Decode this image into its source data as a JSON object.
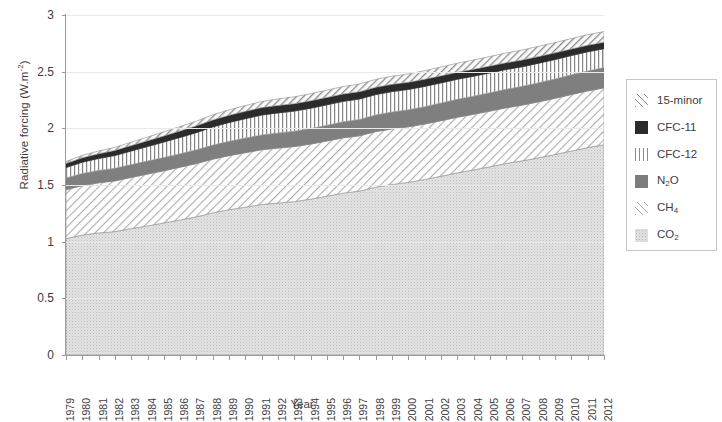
{
  "chart_data": {
    "type": "area",
    "title": "",
    "subtitle": "",
    "xlabel": "Year",
    "ylabel": "Radiative forcing (W.m-2)",
    "ylabel_display": "Radiative forcing (W.m",
    "ylabel_exponent": "-2",
    "ylabel_tail": ")",
    "ylim": [
      0,
      3
    ],
    "ytick_values": [
      0,
      0.5,
      1,
      1.5,
      2,
      2.5,
      3
    ],
    "ytick_labels": [
      "0",
      "0.5",
      "1",
      "1.5",
      "2",
      "2.5",
      "3"
    ],
    "grid": true,
    "legend_position": "right-outside",
    "stacked": true,
    "stack_order_bottom_to_top": [
      "CO2",
      "CH4",
      "N2O",
      "CFC-12",
      "CFC-11",
      "15-minor"
    ],
    "x": [
      1979,
      1980,
      1981,
      1982,
      1983,
      1984,
      1985,
      1986,
      1987,
      1988,
      1989,
      1990,
      1991,
      1992,
      1993,
      1994,
      1995,
      1996,
      1997,
      1998,
      1999,
      2000,
      2001,
      2002,
      2003,
      2004,
      2005,
      2006,
      2007,
      2008,
      2009,
      2010,
      2011,
      2012
    ],
    "categories": [
      "1979",
      "1980",
      "1981",
      "1982",
      "1983",
      "1984",
      "1985",
      "1986",
      "1987",
      "1988",
      "1989",
      "1990",
      "1991",
      "1992",
      "1993",
      "1994",
      "1995",
      "1996",
      "1997",
      "1998",
      "1999",
      "2000",
      "2001",
      "2002",
      "2003",
      "2004",
      "2005",
      "2006",
      "2007",
      "2008",
      "2009",
      "2010",
      "2011",
      "2012"
    ],
    "series": [
      {
        "name": "CO2",
        "label": "CO2",
        "pattern": "light-speckle",
        "color": "#e2e2e2",
        "values": [
          1.027,
          1.058,
          1.077,
          1.089,
          1.115,
          1.139,
          1.165,
          1.191,
          1.219,
          1.254,
          1.282,
          1.304,
          1.328,
          1.341,
          1.353,
          1.375,
          1.401,
          1.428,
          1.446,
          1.481,
          1.505,
          1.523,
          1.549,
          1.577,
          1.607,
          1.633,
          1.661,
          1.69,
          1.713,
          1.74,
          1.769,
          1.8,
          1.83,
          1.855
        ]
      },
      {
        "name": "CH4",
        "label": "CH4",
        "pattern": "diagonal-hatch-light",
        "color": "#a8a8a8",
        "values": [
          0.431,
          0.437,
          0.442,
          0.447,
          0.452,
          0.457,
          0.461,
          0.466,
          0.47,
          0.474,
          0.477,
          0.481,
          0.483,
          0.485,
          0.486,
          0.486,
          0.487,
          0.488,
          0.488,
          0.49,
          0.49,
          0.49,
          0.489,
          0.49,
          0.491,
          0.491,
          0.491,
          0.491,
          0.492,
          0.494,
          0.496,
          0.498,
          0.5,
          0.502
        ]
      },
      {
        "name": "N2O",
        "label": "N2O",
        "pattern": "solid-medium-gray",
        "color": "#7d7d7d",
        "values": [
          0.104,
          0.107,
          0.109,
          0.111,
          0.113,
          0.115,
          0.117,
          0.119,
          0.121,
          0.124,
          0.126,
          0.129,
          0.131,
          0.133,
          0.135,
          0.137,
          0.139,
          0.142,
          0.144,
          0.147,
          0.149,
          0.151,
          0.153,
          0.156,
          0.158,
          0.16,
          0.162,
          0.164,
          0.166,
          0.169,
          0.171,
          0.174,
          0.176,
          0.179
        ]
      },
      {
        "name": "CFC-12",
        "label": "CFC-12",
        "pattern": "vertical-lines",
        "color": "#8a8a8a",
        "values": [
          0.092,
          0.099,
          0.106,
          0.113,
          0.12,
          0.128,
          0.136,
          0.144,
          0.152,
          0.16,
          0.166,
          0.171,
          0.175,
          0.177,
          0.178,
          0.179,
          0.18,
          0.18,
          0.18,
          0.18,
          0.18,
          0.179,
          0.179,
          0.178,
          0.177,
          0.176,
          0.175,
          0.174,
          0.173,
          0.172,
          0.171,
          0.17,
          0.169,
          0.167
        ]
      },
      {
        "name": "CFC-11",
        "label": "CFC-11",
        "pattern": "solid-black",
        "color": "#2b2b2b",
        "values": [
          0.036,
          0.039,
          0.042,
          0.045,
          0.048,
          0.051,
          0.054,
          0.057,
          0.06,
          0.062,
          0.064,
          0.065,
          0.066,
          0.066,
          0.066,
          0.066,
          0.066,
          0.065,
          0.065,
          0.064,
          0.064,
          0.063,
          0.063,
          0.062,
          0.062,
          0.061,
          0.061,
          0.06,
          0.06,
          0.059,
          0.059,
          0.058,
          0.058,
          0.057
        ]
      },
      {
        "name": "15-minor",
        "label": "15-minor",
        "pattern": "diagonal-hatch",
        "color": "#8e8e8e",
        "values": [
          0.018,
          0.021,
          0.024,
          0.027,
          0.03,
          0.033,
          0.036,
          0.039,
          0.042,
          0.045,
          0.048,
          0.051,
          0.054,
          0.057,
          0.06,
          0.062,
          0.064,
          0.066,
          0.068,
          0.07,
          0.072,
          0.074,
          0.076,
          0.078,
          0.08,
          0.082,
          0.084,
          0.086,
          0.088,
          0.09,
          0.091,
          0.092,
          0.093,
          0.094
        ]
      }
    ],
    "stack_totals": [
      1.708,
      1.761,
      1.8,
      1.832,
      1.878,
      1.923,
      1.969,
      2.016,
      2.064,
      2.119,
      2.163,
      2.201,
      2.237,
      2.259,
      2.278,
      2.305,
      2.337,
      2.369,
      2.391,
      2.432,
      2.46,
      2.48,
      2.509,
      2.541,
      2.575,
      2.603,
      2.634,
      2.665,
      2.692,
      2.724,
      2.757,
      2.792,
      2.826,
      2.854
    ]
  },
  "legend": {
    "items": [
      {
        "label": "15-minor",
        "swatch": "pat-minor",
        "name": "legend-swatch-15-minor"
      },
      {
        "label": "CFC-11",
        "swatch": "pat-cfc11",
        "name": "legend-swatch-cfc-11"
      },
      {
        "label": "CFC-12",
        "swatch": "pat-cfc12",
        "name": "legend-swatch-cfc-12"
      },
      {
        "label": "N",
        "sub": "2",
        "tail": "O",
        "swatch": "pat-n2o",
        "name": "legend-swatch-n2o"
      },
      {
        "label": "CH",
        "sub": "4",
        "tail": "",
        "swatch": "pat-ch4",
        "name": "legend-swatch-ch4"
      },
      {
        "label": "CO",
        "sub": "2",
        "tail": "",
        "swatch": "pat-co2",
        "name": "legend-swatch-co2"
      }
    ]
  }
}
